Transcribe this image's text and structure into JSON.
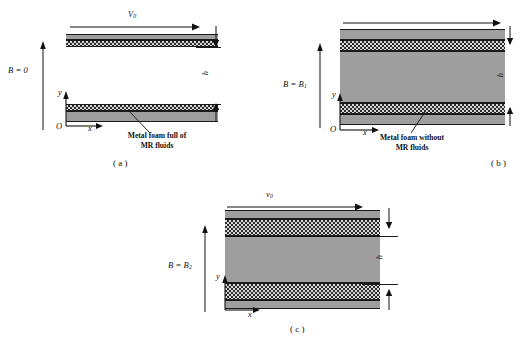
{
  "figure": {
    "type": "schematic-diagram",
    "background_color": "#ffffff",
    "line_color": "#111111",
    "gray_fill": "#9e9e9e",
    "checker_fill": "#2b2b2b"
  },
  "panels": [
    {
      "id": "a",
      "caption": "( a )",
      "field_label": "B = 0",
      "field_symbol": "B",
      "field_value": "0",
      "velocity_label": "V",
      "velocity_sub": "0",
      "height_label": "h",
      "axis_origin": "O",
      "axis_x": "x",
      "axis_y": "y",
      "annotation_line1": "Metal foam full of",
      "annotation_line2": "MR fluids",
      "annotation_full": "Metal foam full of MR fluids",
      "layers": [
        {
          "name": "upper-gray-layer",
          "material": "metal-foam",
          "fill": "gray"
        },
        {
          "name": "upper-checker-layer",
          "material": "mr-fluid-foam",
          "fill": "checker"
        },
        {
          "name": "open-channel-gap",
          "material": "free-fluid",
          "fill": "none"
        },
        {
          "name": "lower-checker-layer",
          "material": "mr-fluid-foam",
          "fill": "checker"
        },
        {
          "name": "lower-gray-layer",
          "material": "metal-foam",
          "fill": "gray"
        }
      ]
    },
    {
      "id": "b",
      "caption": "( b )",
      "field_label": "B = B",
      "field_symbol": "B",
      "field_value": "B",
      "field_sub": "1",
      "height_label": "h",
      "axis_origin": "O",
      "axis_x": "x",
      "axis_y": "y",
      "annotation_line1": "Metal foam without",
      "annotation_line2": "MR fluids",
      "annotation_full": "Metal foam without MR fluids",
      "layers": [
        {
          "name": "upper-gray-layer",
          "material": "metal-foam",
          "fill": "gray"
        },
        {
          "name": "upper-checker-layer",
          "material": "solidified-mr",
          "fill": "checker"
        },
        {
          "name": "core-gray-layer",
          "material": "bulk-fluid",
          "fill": "gray"
        },
        {
          "name": "lower-checker-layer",
          "material": "solidified-mr",
          "fill": "checker"
        },
        {
          "name": "lower-gray-layer",
          "material": "metal-foam",
          "fill": "gray"
        }
      ]
    },
    {
      "id": "c",
      "caption": "( c )",
      "field_label": "B = B",
      "field_symbol": "B",
      "field_value": "B",
      "field_sub": "2",
      "velocity_label": "v",
      "velocity_sub": "0",
      "height_label": "h",
      "axis_x": "x",
      "axis_y": "y",
      "layers": [
        {
          "name": "upper-gray-layer",
          "material": "metal-foam",
          "fill": "gray"
        },
        {
          "name": "upper-checker-layer",
          "material": "solidified-mr",
          "fill": "checker"
        },
        {
          "name": "core-gray-layer",
          "material": "bulk-fluid",
          "fill": "gray"
        },
        {
          "name": "lower-checker-layer",
          "material": "solidified-mr",
          "fill": "checker"
        },
        {
          "name": "lower-gray-layer",
          "material": "metal-foam",
          "fill": "gray"
        }
      ]
    }
  ]
}
